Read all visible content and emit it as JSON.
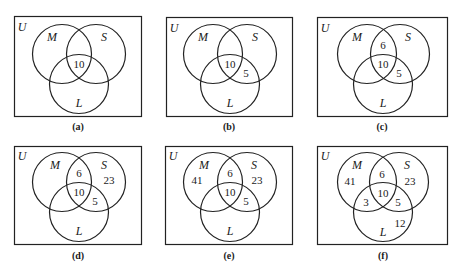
{
  "figure": {
    "universe_label": "U",
    "set_labels": {
      "M": "M",
      "S": "S",
      "L": "L"
    },
    "stroke_color": "#222222",
    "panels": [
      {
        "id": "a",
        "caption": "(a)",
        "regions": {
          "center": "10"
        }
      },
      {
        "id": "b",
        "caption": "(b)",
        "regions": {
          "center": "10",
          "S_L": "5"
        }
      },
      {
        "id": "c",
        "caption": "(c)",
        "regions": {
          "M_S": "6",
          "center": "10",
          "S_L": "5"
        }
      },
      {
        "id": "d",
        "caption": "(d)",
        "regions": {
          "M_S": "6",
          "S_only": "23",
          "center": "10",
          "S_L": "5"
        }
      },
      {
        "id": "e",
        "caption": "(e)",
        "regions": {
          "M_only": "41",
          "M_S": "6",
          "S_only": "23",
          "center": "10",
          "S_L": "5"
        }
      },
      {
        "id": "f",
        "caption": "(f)",
        "regions": {
          "M_only": "41",
          "M_S": "6",
          "S_only": "23",
          "center": "10",
          "M_L": "3",
          "S_L": "5",
          "L_only": "12"
        }
      }
    ]
  }
}
